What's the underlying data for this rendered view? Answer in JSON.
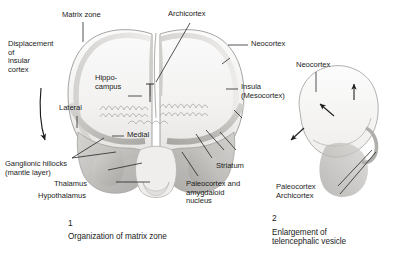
{
  "figure": {
    "background_color": "#ffffff",
    "ink_color": "#1c1c1c",
    "tissue_fill": "#f0efee",
    "tissue_shade": "#c9c7c4",
    "tissue_shade_dark": "#a8a6a3",
    "outline_color": "#9a9895"
  },
  "panel1": {
    "caption_number": "1",
    "caption_text": "Organization of matrix zone",
    "labels": {
      "displacement": "Displacement\nof\ninsular\ncortex",
      "matrix_zone": "Matrix zone",
      "archicortex": "Archicortex",
      "neocortex": "Neocortex",
      "hippocampus": "Hippo-\ncampus",
      "insula": "Insula\n(Mesocortex)",
      "lateral": "Lateral",
      "medial": "Medial",
      "ganglionic_hillocks": "Ganglionic hillocks\n(mantle layer)",
      "thalamus": "Thalamus",
      "hypothalamus": "Hypothalamus",
      "striatum": "Striatum",
      "paleocortex_amygdaloid": "Paleocortex and\namygdaloid\nnucleus"
    }
  },
  "panel2": {
    "caption_number": "2",
    "caption_text": "Enlargement of\ntelencephalic vesicle",
    "labels": {
      "neocortex": "Neocortex",
      "paleocortex": "Paleocortex",
      "archicortex": "Archicortex"
    },
    "arrows": [
      "growth-arrow-up",
      "growth-arrow-upleft",
      "growth-arrow-downleft"
    ]
  }
}
